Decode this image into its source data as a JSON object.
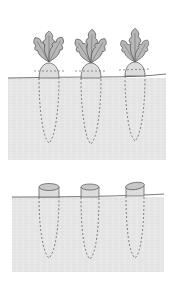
{
  "illustration": {
    "subject": "root vegetables in soil, before and after topping",
    "colors": {
      "background": "#ffffff",
      "soil": "#e6e6e6",
      "soil_texture": "#d4d4d4",
      "line": "#555555",
      "leaf_fill": "#b8b8b8",
      "crown_fill": "#dcdcdc"
    },
    "panels": [
      {
        "name": "with-tops",
        "ground_y": 78,
        "soil_bottom": 160,
        "plants": [
          {
            "x": 49,
            "root_bottom": 143
          },
          {
            "x": 91,
            "root_bottom": 144
          },
          {
            "x": 135,
            "root_bottom": 141
          }
        ]
      },
      {
        "name": "tops-removed",
        "ground_y": 197,
        "soil_bottom": 272,
        "plants": [
          {
            "x": 49,
            "root_bottom": 258
          },
          {
            "x": 90,
            "root_bottom": 259
          },
          {
            "x": 135,
            "root_bottom": 258
          }
        ]
      }
    ]
  }
}
